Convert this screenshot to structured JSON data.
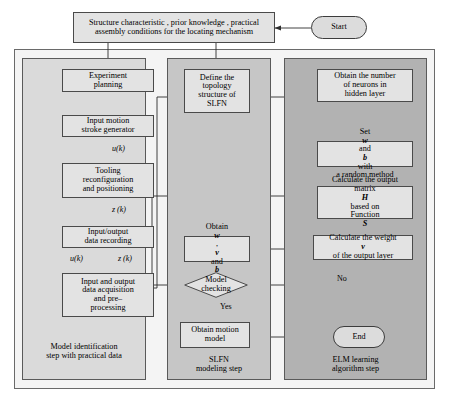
{
  "diagram": {
    "colors": {
      "panel_left": "#dadada",
      "panel_mid": "#c6c6c6",
      "panel_right": "#b2b2b2",
      "node_fill": "#e3e3e3",
      "terminator_fill": "#dcdcdc",
      "stroke": "#4a4a4a",
      "background": "#ffffff"
    }
  },
  "top": {
    "input_box": "Structure characteristic , prior knowledge , practical assembly conditions for the locating mechanism",
    "input_box_line1": "Structure characteristic , prior knowledge , practical",
    "input_box_line2": "assembly conditions for the locating mechanism",
    "start_label": "Start"
  },
  "panels": [
    {
      "id": "left",
      "caption_line1": "Model identification",
      "caption_line2": "step with practical data"
    },
    {
      "id": "mid",
      "caption_line1": "SLFN",
      "caption_line2": "modeling step"
    },
    {
      "id": "right",
      "caption_line1": "ELM learning",
      "caption_line2": "algorithm step"
    }
  ],
  "left_column": {
    "nodes": [
      {
        "id": "experiment-planning",
        "lines": [
          "Experiment",
          "planning"
        ]
      },
      {
        "id": "input-motion-stroke-generator",
        "lines": [
          "Input motion",
          "stroke generator"
        ]
      },
      {
        "id": "tooling-reconfiguration",
        "lines": [
          "Tooling",
          "reconfiguration",
          "and positioning"
        ]
      },
      {
        "id": "input-output-data-recording",
        "lines": [
          "Input/output",
          "data recording"
        ]
      },
      {
        "id": "input-output-data-acquisition",
        "lines": [
          "Input and output",
          "data acquisition",
          "and pre–",
          "processing"
        ]
      }
    ],
    "edge_labels": {
      "uk_top": "u(k)",
      "zk_mid": "z (k)",
      "uk_bottom": "u(k)",
      "zk_bottom": "z (k)"
    }
  },
  "mid_column": {
    "nodes": [
      {
        "id": "define-topology-structure",
        "lines": [
          "Define the",
          "topology",
          "structure of",
          "SLFN"
        ]
      },
      {
        "id": "obtain-w-v-b",
        "lines": [
          "Obtain w,",
          "v and b"
        ],
        "line1_prefix": "Obtain ",
        "line1_sym": "w",
        "line1_suffix": ",",
        "line2_sym1": "v",
        "line2_mid": " and ",
        "line2_sym2": "b"
      },
      {
        "id": "model-checking",
        "lines": [
          "Model",
          "checking"
        ],
        "shape": "diamond"
      },
      {
        "id": "obtain-motion-model",
        "lines": [
          "Obtain motion",
          "model"
        ]
      }
    ],
    "edge_labels": {
      "yes": "Yes"
    }
  },
  "right_column": {
    "nodes": [
      {
        "id": "obtain-number-of-neurons",
        "lines": [
          "Obtain the number",
          "of neurons in",
          "hidden layer"
        ]
      },
      {
        "id": "set-w-and-b",
        "line1_prefix": "Set ",
        "line1_sym1": "w",
        "line1_mid": " and ",
        "line1_sym2": "b",
        "line1_suffix": " with",
        "line2": "a random method",
        "lines": [
          "Set w and b with",
          "a random method"
        ]
      },
      {
        "id": "calculate-output-matrix",
        "line1": "Calculate the output",
        "line2_prefix": "matrix ",
        "line2_sym": "H",
        "line2_suffix": " based on",
        "line3_prefix": "Function ",
        "line3_sym": "S",
        "lines": [
          "Calculate the output",
          "matrix H based on",
          "Function S"
        ]
      },
      {
        "id": "calculate-weight-v",
        "line1": "Calculate the weight",
        "line2_sym": "v",
        "line2_suffix": " of the output layer",
        "lines": [
          "Calculate the weight",
          "v of the output layer"
        ]
      },
      {
        "id": "end-terminator",
        "lines": [
          "End"
        ],
        "shape": "terminator"
      }
    ],
    "edge_labels": {
      "no": "No"
    }
  }
}
